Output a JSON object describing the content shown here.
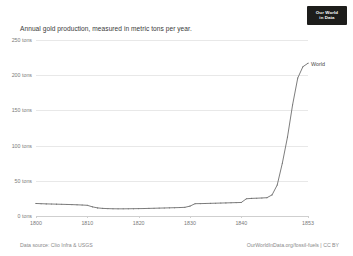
{
  "logo": {
    "line1": "Our World",
    "line2": "in Data"
  },
  "footer": {
    "source": "Data source: Clio Infra & USGS",
    "attribution": "OurWorldInData.org/fossil-fuels | CC BY"
  },
  "chart_data": {
    "type": "line",
    "title": "Annual gold production, measured in metric tons per year.",
    "xlabel": "",
    "ylabel": "",
    "xlim": [
      1800,
      1853
    ],
    "ylim": [
      0,
      250
    ],
    "grid": true,
    "legend_position": "inline-end",
    "ytick_labels": [
      "250 tons",
      "200 tons",
      "150 tons",
      "100 tons",
      "50 tons",
      "0 tons"
    ],
    "ytick_values": [
      250,
      200,
      150,
      100,
      50,
      0
    ],
    "xtick_labels": [
      "1800",
      "1810",
      "1820",
      "1830",
      "1840",
      "1853"
    ],
    "xtick_values": [
      1800,
      1810,
      1820,
      1830,
      1840,
      1853
    ],
    "series": [
      {
        "name": "World",
        "color": "#6e6e6e",
        "x": [
          1800,
          1801,
          1802,
          1803,
          1804,
          1805,
          1806,
          1807,
          1808,
          1809,
          1810,
          1811,
          1812,
          1813,
          1814,
          1815,
          1816,
          1817,
          1818,
          1819,
          1820,
          1821,
          1822,
          1823,
          1824,
          1825,
          1826,
          1827,
          1828,
          1829,
          1830,
          1831,
          1832,
          1833,
          1834,
          1835,
          1836,
          1837,
          1838,
          1839,
          1840,
          1841,
          1842,
          1843,
          1844,
          1845,
          1846,
          1847,
          1848,
          1849,
          1850,
          1851,
          1852,
          1853
        ],
        "values": [
          17.8,
          17.5,
          17.2,
          17.0,
          16.8,
          16.6,
          16.4,
          16.2,
          15.9,
          15.6,
          15.2,
          13.0,
          11.5,
          10.8,
          10.5,
          10.3,
          10.2,
          10.2,
          10.3,
          10.4,
          10.5,
          10.6,
          10.8,
          11.0,
          11.2,
          11.4,
          11.6,
          11.8,
          12.0,
          12.3,
          14.0,
          17.5,
          17.6,
          17.8,
          18.0,
          18.2,
          18.4,
          18.6,
          18.8,
          19.0,
          19.2,
          24.5,
          25.0,
          25.3,
          25.6,
          26.0,
          30.0,
          44.0,
          75.0,
          112.0,
          158.0,
          196.0,
          212.0,
          217.0
        ]
      }
    ]
  }
}
